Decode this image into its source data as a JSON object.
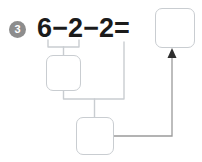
{
  "problem": {
    "number": "3",
    "equation": {
      "operand_1": "6",
      "operator_1": "−",
      "operand_2": "2",
      "operator_2": "−",
      "operand_3": "2",
      "equals": "="
    }
  },
  "boxes": {
    "answer": "",
    "step_1": "",
    "step_2": ""
  },
  "colors": {
    "badge_fill": "#8d8d8d",
    "badge_text": "#ffffff",
    "equation_text": "#1b1b1b",
    "box_border": "#c9cdd1",
    "wire": "#c9cdd1",
    "arrow": "#2e2e2e",
    "background": "#ffffff"
  }
}
